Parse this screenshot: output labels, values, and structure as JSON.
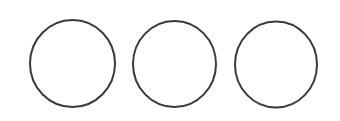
{
  "figure": {
    "type": "line-drawing",
    "width": 340,
    "height": 121,
    "background_color": "#ffffff",
    "shape_count": 3,
    "stroke_color": "#3a3a3c",
    "stroke_width": 2,
    "fill": "none",
    "shapes": [
      {
        "name": "circle-1",
        "kind": "circle",
        "center_x": 72.5,
        "center_y": 63.5,
        "radius_x": 42.5,
        "radius_y": 43.5,
        "rotation": 0,
        "stroke_color": "#3a3a3c",
        "stroke_width": 2,
        "fill": "none"
      },
      {
        "name": "circle-2",
        "kind": "circle",
        "center_x": 174.5,
        "center_y": 64.0,
        "radius_x": 41.5,
        "radius_y": 43.0,
        "rotation": 0,
        "stroke_color": "#3a3a3c",
        "stroke_width": 2,
        "fill": "none"
      },
      {
        "name": "circle-3",
        "kind": "circle",
        "center_x": 276.0,
        "center_y": 64.5,
        "radius_x": 41.0,
        "radius_y": 43.0,
        "rotation": 0,
        "stroke_color": "#3a3a3c",
        "stroke_width": 2,
        "fill": "none"
      }
    ]
  }
}
